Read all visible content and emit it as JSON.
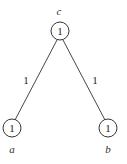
{
  "diagram": {
    "type": "tree",
    "nodes": [
      {
        "id": "c",
        "label": "c",
        "value": "1"
      },
      {
        "id": "a",
        "label": "a",
        "value": "1"
      },
      {
        "id": "b",
        "label": "b",
        "value": "1"
      }
    ],
    "edges": [
      {
        "from": "c",
        "to": "a",
        "weight": "1"
      },
      {
        "from": "c",
        "to": "b",
        "weight": "1"
      }
    ]
  }
}
